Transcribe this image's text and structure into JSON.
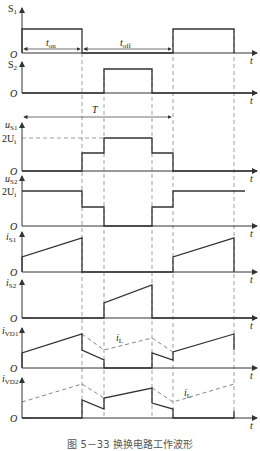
{
  "figure": {
    "caption": "图 5－33   换换电路工作波形",
    "timing": {
      "t_on_label": "t",
      "t_on_sub": "on",
      "t_off_label": "t",
      "t_off_sub": "off",
      "period_label": "T"
    },
    "time_axis_label": "t",
    "origin_label": "O",
    "voltage_level_label": "2U",
    "voltage_level_sub": "i",
    "inductor_current_label": "i",
    "inductor_current_sub": "L",
    "traces": [
      {
        "id": "S1",
        "label": "S",
        "sub": "1"
      },
      {
        "id": "S2",
        "label": "S",
        "sub": "2"
      },
      {
        "id": "uS1",
        "label": "u",
        "sub": "S1"
      },
      {
        "id": "uS2",
        "label": "u",
        "sub": "S2"
      },
      {
        "id": "iS1",
        "label": "i",
        "sub": "S1"
      },
      {
        "id": "iS2",
        "label": "i",
        "sub": "S2"
      },
      {
        "id": "iVD1",
        "label": "i",
        "sub": "VD1"
      },
      {
        "id": "iVD2",
        "label": "i",
        "sub": "VD2"
      }
    ],
    "colors": {
      "line": "#333333",
      "dash": "#666666"
    }
  }
}
